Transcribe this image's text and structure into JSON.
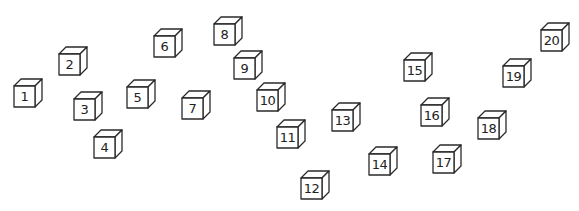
{
  "scene": {
    "stroke_color": "#2a2a2a",
    "background": "#ffffff",
    "cubes": [
      {
        "label": "1",
        "x": 13,
        "y": 78
      },
      {
        "label": "2",
        "x": 58,
        "y": 46
      },
      {
        "label": "3",
        "x": 73,
        "y": 91
      },
      {
        "label": "4",
        "x": 93,
        "y": 129
      },
      {
        "label": "5",
        "x": 126,
        "y": 79
      },
      {
        "label": "6",
        "x": 153,
        "y": 28
      },
      {
        "label": "7",
        "x": 181,
        "y": 90
      },
      {
        "label": "8",
        "x": 213,
        "y": 16
      },
      {
        "label": "9",
        "x": 233,
        "y": 50
      },
      {
        "label": "10",
        "x": 256,
        "y": 82
      },
      {
        "label": "11",
        "x": 276,
        "y": 119
      },
      {
        "label": "12",
        "x": 300,
        "y": 170
      },
      {
        "label": "13",
        "x": 331,
        "y": 102
      },
      {
        "label": "14",
        "x": 368,
        "y": 146
      },
      {
        "label": "15",
        "x": 403,
        "y": 52
      },
      {
        "label": "16",
        "x": 420,
        "y": 97
      },
      {
        "label": "17",
        "x": 432,
        "y": 144
      },
      {
        "label": "18",
        "x": 477,
        "y": 110
      },
      {
        "label": "19",
        "x": 502,
        "y": 58
      },
      {
        "label": "20",
        "x": 540,
        "y": 22
      }
    ]
  }
}
